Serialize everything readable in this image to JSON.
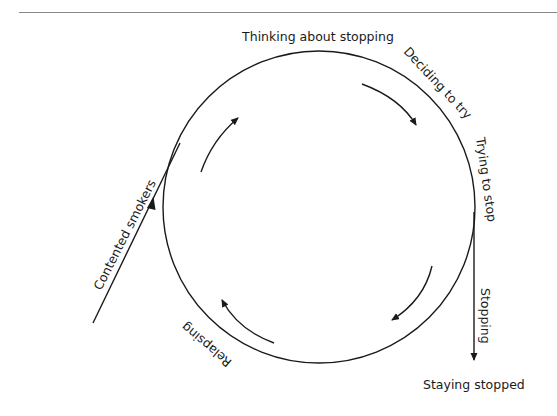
{
  "diagram": {
    "stages": {
      "thinking": "Thinking about stopping",
      "deciding": "Deciding to try",
      "trying": "Trying to stop",
      "stopping": "Stopping",
      "staying": "Staying stopped",
      "relapsing": "Relapsing",
      "contented": "Contented smokers"
    },
    "colors": {
      "line": "#1a1a1a",
      "rule": "#8a8a8a",
      "background": "#ffffff"
    }
  }
}
